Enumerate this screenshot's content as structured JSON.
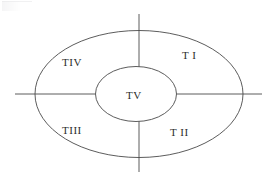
{
  "diagram": {
    "type": "venn-quadrant-ellipse-diagram",
    "background_color": "#ffffff",
    "stroke_color": "#4a4a4a",
    "text_color": "#2b2b2b",
    "canvas": {
      "width": 270,
      "height": 185
    },
    "outer_ellipse": {
      "cx": 139,
      "cy": 94,
      "rx": 104,
      "ry": 63.5
    },
    "inner_ellipse": {
      "cx": 136,
      "cy": 94,
      "rx": 40.5,
      "ry": 27.5
    },
    "axes": {
      "vertical": {
        "x": 139,
        "y_top": 14,
        "y_bottom": 172
      },
      "horizontal": {
        "y": 94,
        "x_left": 15,
        "x_right": 262
      }
    },
    "labels": [
      {
        "id": "t-one",
        "text": "T I",
        "x": 182,
        "y": 59,
        "region": "upper-right"
      },
      {
        "id": "t-two",
        "text": "T II",
        "x": 170,
        "y": 136,
        "region": "lower-right"
      },
      {
        "id": "t-three",
        "text": "TIII",
        "x": 62,
        "y": 134,
        "region": "lower-left"
      },
      {
        "id": "t-four",
        "text": "TIV",
        "x": 62,
        "y": 66,
        "region": "upper-left"
      },
      {
        "id": "t-five",
        "text": "TV",
        "x": 126,
        "y": 99,
        "region": "center"
      }
    ]
  }
}
